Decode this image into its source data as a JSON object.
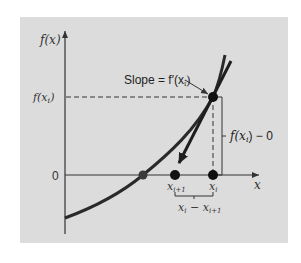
{
  "figure": {
    "type": "newton-raphson-method-diagram",
    "background": "#dcdcdc",
    "curve_color": "#2a2a2a",
    "axis_color": "#333333"
  },
  "axes": {
    "y_label": "f(x)",
    "x_label": "x",
    "origin_label": "0",
    "y_tick_label": "f(x",
    "y_tick_sub": "i",
    "y_tick_close": ")"
  },
  "annotations": {
    "slope_text": "Slope = f′(x",
    "slope_sub": "i",
    "slope_close": ")",
    "rise_text": "f(x",
    "rise_sub": "i",
    "rise_close": ") − 0",
    "run_text_a": "x",
    "run_sub_a": "i",
    "run_mid": " − x",
    "run_sub_b": "i+1"
  },
  "points": {
    "xi_label": "x",
    "xi_sub": "i",
    "xi1_label": "x",
    "xi1_sub": "i+1"
  }
}
